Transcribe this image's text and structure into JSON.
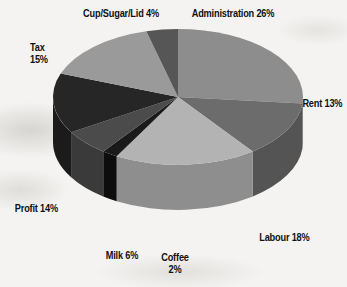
{
  "chart_data": {
    "type": "pie",
    "title": "",
    "subtitle": "",
    "xlabel": "",
    "ylabel": "",
    "legend_position": "none",
    "grid": false,
    "three_d": true,
    "value_suffix": "%",
    "categories": [
      "Administration",
      "Rent",
      "Labour",
      "Coffee",
      "Milk",
      "Profit",
      "Tax",
      "Cup/Sugar/Lid"
    ],
    "values": [
      26,
      13,
      18,
      2,
      6,
      14,
      15,
      4
    ],
    "slices": [
      {
        "name": "Administration",
        "value": 26,
        "label": "Administration 26%",
        "color": "#8d8d8d",
        "side_color": "#6f6f6f"
      },
      {
        "name": "Rent",
        "value": 13,
        "label": "Rent 13%",
        "color": "#6c6c6c",
        "side_color": "#545454"
      },
      {
        "name": "Labour",
        "value": 18,
        "label": "Labour 18%",
        "color": "#b3b3b3",
        "side_color": "#8e8e8e"
      },
      {
        "name": "Coffee",
        "value": 2,
        "label": "Coffee\n2%",
        "color": "#1a1a1a",
        "side_color": "#0d0d0d"
      },
      {
        "name": "Milk",
        "value": 6,
        "label": "Milk 6%",
        "color": "#4b4b4b",
        "side_color": "#3a3a3a"
      },
      {
        "name": "Profit",
        "value": 14,
        "label": "Profit 14%",
        "color": "#262626",
        "side_color": "#1b1b1b"
      },
      {
        "name": "Tax",
        "value": 15,
        "label": "Tax\n15%",
        "color": "#9a9a9a",
        "side_color": "#7a7a7a"
      },
      {
        "name": "Cup/Sugar/Lid",
        "value": 4,
        "label": "Cup/Sugar/Lid 4%",
        "color": "#565656",
        "side_color": "#434343"
      }
    ]
  },
  "labels": {
    "cup_sugar_lid": "Cup/Sugar/Lid 4%",
    "administration": "Administration 26%",
    "tax_name": "Tax",
    "tax_value": "15%",
    "rent": "Rent 13%",
    "labour": "Labour 18%",
    "coffee_name": "Coffee",
    "coffee_value": "2%",
    "milk": "Milk 6%",
    "profit": "Profit 14%"
  }
}
